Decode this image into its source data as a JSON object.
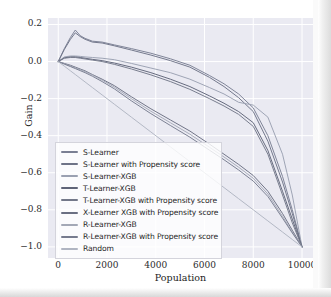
{
  "figure": {
    "style": "seaborn-darkgrid",
    "plot_bg": "#eaeaf2",
    "grid_color": "#ffffff",
    "page_bg": "#ffffff"
  },
  "axes": {
    "ylabel": "Gain",
    "xlabel": "Population",
    "yticks": [
      "0.2",
      "0.0",
      "-0.2",
      "-0.4",
      "-0.6",
      "-0.8",
      "-1.0"
    ],
    "xticks": [
      "0",
      "2000",
      "4000",
      "6000",
      "8000",
      "10000"
    ]
  },
  "chart_data": {
    "type": "line",
    "title": "",
    "xlabel": "Population",
    "ylabel": "Gain",
    "xlim": [
      -420,
      10450
    ],
    "ylim": [
      -1.06,
      0.235
    ],
    "grid": true,
    "legend_position": "lower-left",
    "x": [
      0,
      250,
      500,
      700,
      900,
      1100,
      1400,
      1800,
      2300,
      3000,
      3800,
      4600,
      5400,
      6200,
      6800,
      7400,
      8000,
      8600,
      9200,
      9600,
      10000
    ],
    "series": [
      {
        "name": "S-Learner",
        "color": "#7a7f93",
        "values": [
          0.0,
          0.07,
          0.13,
          0.17,
          0.14,
          0.125,
          0.11,
          0.105,
          0.09,
          0.07,
          0.045,
          0.015,
          -0.02,
          -0.075,
          -0.12,
          -0.175,
          -0.25,
          -0.4,
          -0.62,
          -0.8,
          -1.0
        ]
      },
      {
        "name": "S-Learner with Propensity score",
        "color": "#6e7387",
        "values": [
          0.0,
          0.065,
          0.12,
          0.155,
          0.135,
          0.12,
          0.105,
          0.1,
          0.085,
          0.062,
          0.035,
          0.005,
          -0.03,
          -0.085,
          -0.135,
          -0.195,
          -0.27,
          -0.43,
          -0.65,
          -0.82,
          -1.0
        ]
      },
      {
        "name": "S-Learner-XGB",
        "color": "#9aa0b1",
        "values": [
          0.0,
          0.025,
          0.03,
          0.03,
          0.028,
          0.025,
          0.022,
          0.018,
          0.01,
          -0.01,
          -0.035,
          -0.06,
          -0.095,
          -0.14,
          -0.175,
          -0.22,
          -0.235,
          -0.3,
          -0.5,
          -0.72,
          -1.0
        ]
      },
      {
        "name": "T-Learner-XGB",
        "color": "#5f6478",
        "values": [
          0.0,
          0.02,
          0.025,
          0.025,
          0.022,
          0.018,
          0.012,
          0.005,
          -0.008,
          -0.03,
          -0.06,
          -0.095,
          -0.135,
          -0.185,
          -0.225,
          -0.27,
          -0.33,
          -0.48,
          -0.7,
          -0.85,
          -1.0
        ]
      },
      {
        "name": "T-Learner-XGB with Propensity score",
        "color": "#737889",
        "values": [
          0.0,
          0.018,
          0.022,
          0.022,
          0.018,
          0.014,
          0.008,
          0.0,
          -0.015,
          -0.04,
          -0.072,
          -0.108,
          -0.15,
          -0.2,
          -0.24,
          -0.285,
          -0.35,
          -0.5,
          -0.72,
          -0.87,
          -1.0
        ]
      },
      {
        "name": "X-Learner XGB with Propensity score",
        "color": "#6a6f82",
        "values": [
          0.0,
          -0.01,
          -0.02,
          -0.03,
          -0.04,
          -0.05,
          -0.07,
          -0.095,
          -0.13,
          -0.19,
          -0.255,
          -0.315,
          -0.375,
          -0.445,
          -0.5,
          -0.555,
          -0.615,
          -0.7,
          -0.82,
          -0.91,
          -1.0
        ]
      },
      {
        "name": "R-Learner-XGB",
        "color": "#a3a8b6",
        "values": [
          0.0,
          -0.012,
          -0.024,
          -0.034,
          -0.044,
          -0.054,
          -0.072,
          -0.1,
          -0.138,
          -0.2,
          -0.268,
          -0.33,
          -0.392,
          -0.462,
          -0.515,
          -0.57,
          -0.63,
          -0.715,
          -0.835,
          -0.92,
          -1.0
        ]
      },
      {
        "name": "R-Learner-XGB with Propensity score",
        "color": "#767b8e",
        "values": [
          0.0,
          -0.014,
          -0.027,
          -0.038,
          -0.049,
          -0.06,
          -0.079,
          -0.108,
          -0.147,
          -0.212,
          -0.281,
          -0.345,
          -0.408,
          -0.478,
          -0.53,
          -0.585,
          -0.645,
          -0.728,
          -0.845,
          -0.925,
          -1.0
        ]
      },
      {
        "name": "Random",
        "color": "#b0b5c2",
        "values": [
          0.0,
          -0.025,
          -0.05,
          -0.07,
          -0.09,
          -0.11,
          -0.14,
          -0.18,
          -0.23,
          -0.3,
          -0.38,
          -0.46,
          -0.54,
          -0.62,
          -0.68,
          -0.74,
          -0.8,
          -0.86,
          -0.92,
          -0.96,
          -1.0
        ]
      }
    ]
  }
}
